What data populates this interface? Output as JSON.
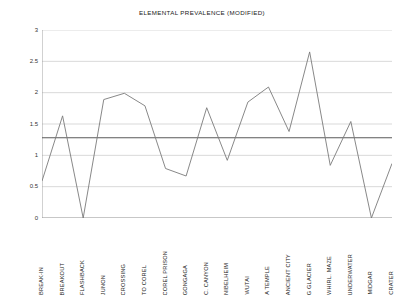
{
  "chart_data": {
    "type": "line",
    "title": "ELEMENTAL PREVALENCE (MODIFIED)",
    "xlabel": "",
    "ylabel": "",
    "ylim": [
      0,
      3
    ],
    "yticks": [
      0,
      0.5,
      1,
      1.5,
      2,
      2.5,
      3
    ],
    "ytick_labels": [
      "0",
      "0.5",
      "1",
      "1.5",
      "2",
      "2.5",
      "3"
    ],
    "grid": true,
    "legend": false,
    "legend_position": "none",
    "line_color": "#7a7a7a",
    "reference_line_color": "#5a5a5a",
    "grid_color": "#c9c9c9",
    "axis_color": "#9a9a9a",
    "categories": [
      "BREAK-IN",
      "BREAKOUT",
      "FLASHBACK",
      "JUNON",
      "CROSSING",
      "TO COREL",
      "COREL PRISON",
      "GONGAGA",
      "C. CANYON",
      "NIBELHEIM",
      "WUTAI",
      "A TEMPLE",
      "ANCIENT CITY",
      "G GLACIER",
      "WHIRL. MAZE",
      "UNDERWATER",
      "MIDGAR",
      "CRATER"
    ],
    "values": [
      0.59,
      1.63,
      0.0,
      1.89,
      1.99,
      1.79,
      0.79,
      0.67,
      1.76,
      0.92,
      1.85,
      2.09,
      1.38,
      2.65,
      0.84,
      1.54,
      0.0,
      0.87
    ],
    "reference_line": {
      "label": "average",
      "value": 1.28
    }
  }
}
